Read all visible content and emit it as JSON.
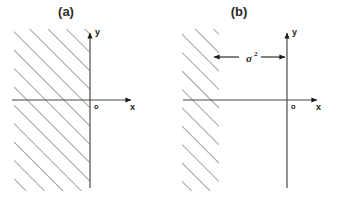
{
  "figure": {
    "background_color": "#ffffff",
    "ink_color": "#4a4a4a",
    "text_color": "#1d1d1d",
    "hatch_color": "#555555"
  },
  "panels": [
    {
      "id": "panel-a",
      "label": "(a)",
      "label_x": 66,
      "label_y": 16,
      "axes": {
        "y_axis_label": "y",
        "x_axis_label": "x",
        "origin_label": "o",
        "y_axis_x": 90,
        "y_axis_top": 30,
        "y_axis_bottom": 188,
        "x_axis_y": 100,
        "x_axis_left": 12,
        "x_axis_right": 136
      },
      "hatch_region": {
        "x": 14,
        "y": 29,
        "width": 76,
        "height": 162,
        "angle_deg": 45,
        "spacing": 13
      },
      "annotation": null
    },
    {
      "id": "panel-b",
      "label": "(b)",
      "label_x": 239,
      "label_y": 16,
      "axes": {
        "y_axis_label": "y",
        "x_axis_label": "x",
        "origin_label": "o",
        "y_axis_x": 287,
        "y_axis_top": 30,
        "y_axis_bottom": 188,
        "x_axis_y": 100,
        "x_axis_left": 183,
        "x_axis_right": 322
      },
      "hatch_region": {
        "x": 182,
        "y": 29,
        "width": 37,
        "height": 162,
        "angle_deg": 45,
        "spacing": 13
      },
      "annotation": {
        "symbol": "σ",
        "exponent": "2",
        "arrow_y": 57,
        "arrow_left_x": 213,
        "arrow_right_x": 286,
        "symbol_x": 246,
        "symbol_y": 61,
        "exponent_x": 254,
        "exponent_y": 55
      }
    }
  ]
}
